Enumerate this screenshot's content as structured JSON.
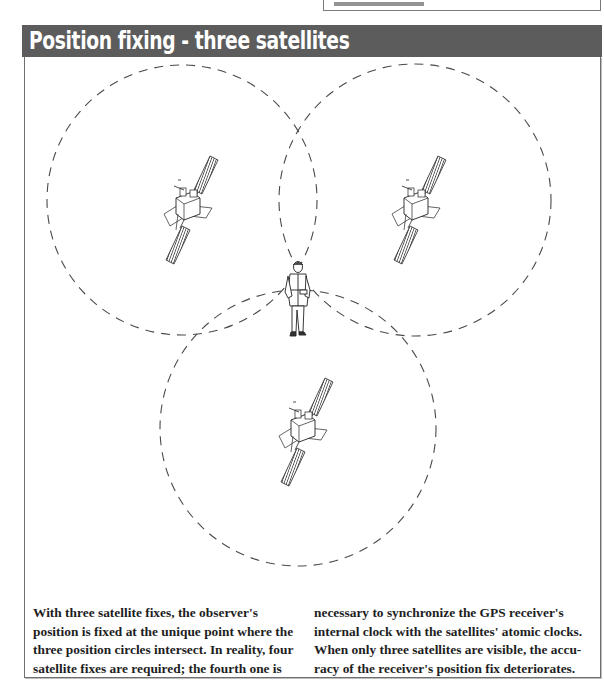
{
  "header": {
    "title": "Position fixing - three satellites",
    "background_color": "#5c5c5c",
    "text_color": "#ffffff"
  },
  "top_box": {
    "note": "partially visible box clipped at top edge; its text is cut off and not legible"
  },
  "diagram": {
    "circle_style": "dashed",
    "circles": [
      {
        "id": "circle-top-left",
        "cx": 182,
        "cy": 200,
        "r": 135
      },
      {
        "id": "circle-top-right",
        "cx": 415,
        "cy": 200,
        "r": 136
      },
      {
        "id": "circle-bottom",
        "cx": 298,
        "cy": 428,
        "r": 138
      }
    ],
    "satellites": [
      {
        "id": "satellite-1",
        "x": 182,
        "y": 210
      },
      {
        "id": "satellite-2",
        "x": 415,
        "y": 210
      },
      {
        "id": "satellite-3",
        "x": 298,
        "y": 432
      }
    ],
    "observer": {
      "x": 297,
      "y": 297
    }
  },
  "caption": {
    "left_lines": [
      "With three satellite fixes, the observer's",
      "position is fixed at the unique point where the",
      "three position circles intersect. In reality, four",
      "satellite fixes are required; the fourth one is"
    ],
    "right_lines": [
      "necessary to synchronize the GPS receiver's",
      "internal clock with the satellites' atomic clocks.",
      "When only three satellites are visible, the accu-",
      "racy of the receiver's position fix deteriorates."
    ]
  }
}
